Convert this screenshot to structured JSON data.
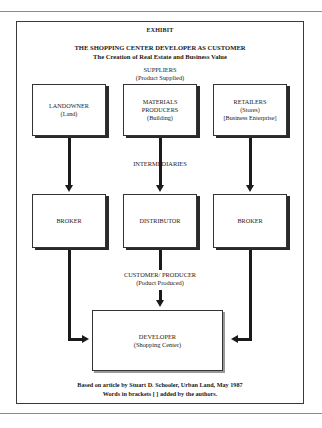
{
  "header": {
    "exhibit": "EXHIBIT",
    "title": "THE SHOPPING CENTER DEVELOPER AS CUSTOMER",
    "subtitle": "The Creation of Real Estate and Business Value"
  },
  "suppliers": {
    "label": "SUPPLIERS",
    "sublabel": "(Product Supplied)",
    "boxes": [
      {
        "lines": [
          "LANDOWNER",
          "(Land)"
        ]
      },
      {
        "lines": [
          "MATERIALS",
          "PRODUCERS",
          "(Building)"
        ]
      },
      {
        "lines": [
          "RETAILERS",
          "(Stores)",
          "[Business Enterprise]"
        ]
      }
    ]
  },
  "intermediaries": {
    "label": "INTERMEDIARIES",
    "boxes": [
      {
        "lines": [
          "BROKER"
        ]
      },
      {
        "lines": [
          "DISTRIBUTOR"
        ]
      },
      {
        "lines": [
          "BROKER"
        ]
      }
    ]
  },
  "customer": {
    "label": "CUSTOMER/ PRODUCER",
    "sublabel": "(Poduct Produced)",
    "box": {
      "lines": [
        "DEVELOPER",
        "(Shopping Center)"
      ]
    }
  },
  "footer": {
    "line1": "Based on article by Stuart D. Schooler, Urban Land, May 1987",
    "line2": "Words in brackets [ ] added by the authors."
  }
}
